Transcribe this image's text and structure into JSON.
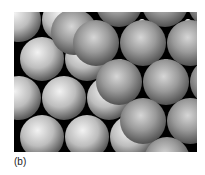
{
  "figure": {
    "caption_label": "(b)",
    "colors": {
      "background": "#000000",
      "back_layer_sphere": "#c8c8c8",
      "front_layer_sphere": "#9a9a9a",
      "interstitial_gap": "#e6e6e6"
    }
  }
}
